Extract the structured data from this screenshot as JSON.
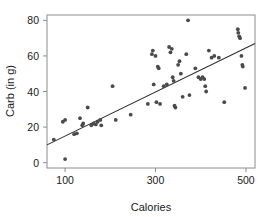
{
  "chart_data": {
    "type": "scatter",
    "title": "",
    "xlabel": "Calories",
    "ylabel": "Carb (in g)",
    "xlim": [
      60,
      520
    ],
    "ylim": [
      -3,
      83
    ],
    "xticks": [
      100,
      300,
      500
    ],
    "yticks": [
      0,
      20,
      40,
      60,
      80
    ],
    "grid": false,
    "legend": null,
    "trendline": {
      "type": "linear-fit",
      "x_start": 60,
      "y_start": 10,
      "x_end": 520,
      "y_end": 67
    },
    "points": [
      {
        "x": 75,
        "y": 13
      },
      {
        "x": 95,
        "y": 23
      },
      {
        "x": 100,
        "y": 24
      },
      {
        "x": 100,
        "y": 2
      },
      {
        "x": 120,
        "y": 16
      },
      {
        "x": 126,
        "y": 16.5
      },
      {
        "x": 133,
        "y": 25
      },
      {
        "x": 138,
        "y": 21
      },
      {
        "x": 140,
        "y": 22
      },
      {
        "x": 150,
        "y": 31
      },
      {
        "x": 158,
        "y": 21
      },
      {
        "x": 163,
        "y": 22
      },
      {
        "x": 168,
        "y": 21.5
      },
      {
        "x": 172,
        "y": 23
      },
      {
        "x": 178,
        "y": 24
      },
      {
        "x": 180,
        "y": 21
      },
      {
        "x": 205,
        "y": 43
      },
      {
        "x": 212,
        "y": 24
      },
      {
        "x": 245,
        "y": 27
      },
      {
        "x": 283,
        "y": 33
      },
      {
        "x": 292,
        "y": 61
      },
      {
        "x": 294,
        "y": 63
      },
      {
        "x": 296,
        "y": 44
      },
      {
        "x": 300,
        "y": 60
      },
      {
        "x": 302,
        "y": 34
      },
      {
        "x": 305,
        "y": 54
      },
      {
        "x": 307,
        "y": 53
      },
      {
        "x": 310,
        "y": 33
      },
      {
        "x": 318,
        "y": 43
      },
      {
        "x": 325,
        "y": 44
      },
      {
        "x": 330,
        "y": 65
      },
      {
        "x": 333,
        "y": 62
      },
      {
        "x": 336,
        "y": 64
      },
      {
        "x": 338,
        "y": 48
      },
      {
        "x": 340,
        "y": 46
      },
      {
        "x": 342,
        "y": 32
      },
      {
        "x": 344,
        "y": 31
      },
      {
        "x": 350,
        "y": 55
      },
      {
        "x": 353,
        "y": 57
      },
      {
        "x": 356,
        "y": 50
      },
      {
        "x": 360,
        "y": 37
      },
      {
        "x": 368,
        "y": 61
      },
      {
        "x": 372,
        "y": 80
      },
      {
        "x": 375,
        "y": 38
      },
      {
        "x": 388,
        "y": 53
      },
      {
        "x": 395,
        "y": 48
      },
      {
        "x": 400,
        "y": 47
      },
      {
        "x": 404,
        "y": 48
      },
      {
        "x": 408,
        "y": 47
      },
      {
        "x": 410,
        "y": 43
      },
      {
        "x": 412,
        "y": 40
      },
      {
        "x": 418,
        "y": 63
      },
      {
        "x": 424,
        "y": 59
      },
      {
        "x": 430,
        "y": 60
      },
      {
        "x": 440,
        "y": 59
      },
      {
        "x": 452,
        "y": 34
      },
      {
        "x": 482,
        "y": 75
      },
      {
        "x": 483,
        "y": 73
      },
      {
        "x": 485,
        "y": 71
      },
      {
        "x": 487,
        "y": 70
      },
      {
        "x": 490,
        "y": 60
      },
      {
        "x": 492,
        "y": 55
      },
      {
        "x": 493,
        "y": 54
      },
      {
        "x": 498,
        "y": 42
      }
    ]
  }
}
